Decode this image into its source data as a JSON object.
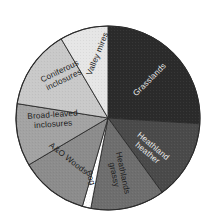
{
  "figure": {
    "title": "",
    "background_color": "#ffffff",
    "outline_color": "#2b2b2b",
    "center_x": 108,
    "center_y": 118,
    "radius": 92
  },
  "chart_data": {
    "type": "pie",
    "title": "",
    "xlabel": "",
    "ylabel": "",
    "legend_position": "none",
    "labels_inside_slices": true,
    "start_angle_deg": 0,
    "direction": "clockwise",
    "categories": [
      "Grasslands",
      "Heathland heather",
      "Heathlands grassy",
      "Bog",
      "A&O Woods",
      "Broad-leaved inclosures",
      "Coniferous inclosures",
      "Valley mires"
    ],
    "values": [
      26,
      14,
      13,
      1.5,
      12,
      11,
      14,
      8.5
    ],
    "colors": [
      "#2b2b2b",
      "#4a4a4a",
      "#6e6e6e",
      "#fefefe",
      "#8c8c8c",
      "#a3a3a3",
      "#c9c9c9",
      "#e6e6e6"
    ],
    "label_text_colors": [
      "#e8e8e8",
      "#e8e8e8",
      "#1c1c1c",
      "#1c1c1c",
      "#1c1c1c",
      "#1c1c1c",
      "#1c1c1c",
      "#1c1c1c"
    ],
    "slices": [
      {
        "name": "Grasslands",
        "label_lines": [
          "Grasslands"
        ],
        "value": 26,
        "color": "#2b2b2b",
        "text_color": "#e8e8e8",
        "label_x": 150,
        "label_y": 80,
        "label_rotation": -45,
        "font_size": 8.2
      },
      {
        "name": "Heathland heather",
        "label_lines": [
          "Heathland",
          "heather"
        ],
        "value": 14,
        "color": "#4a4a4a",
        "text_color": "#e8e8e8",
        "label_x": 150,
        "label_y": 150,
        "label_rotation": 40,
        "font_size": 7.6
      },
      {
        "name": "Heathlands grassy",
        "label_lines": [
          "Heathlands",
          "grassy"
        ],
        "value": 13,
        "color": "#6e6e6e",
        "text_color": "#1c1c1c",
        "label_x": 118,
        "label_y": 174,
        "label_rotation": 78,
        "font_size": 7.6
      },
      {
        "name": "Bog",
        "label_lines": [
          "Bog"
        ],
        "value": 1.5,
        "color": "#fefefe",
        "text_color": "#1c1c1c",
        "label_x": 90,
        "label_y": 178,
        "label_rotation": 71,
        "font_size": 5.6
      },
      {
        "name": "A&O Woods",
        "label_lines": [
          "A&O Woods"
        ],
        "value": 12,
        "color": "#8c8c8c",
        "text_color": "#1c1c1c",
        "label_x": 68,
        "label_y": 159,
        "label_rotation": 38,
        "font_size": 8.2
      },
      {
        "name": "Broad-leaved inclosures",
        "label_lines": [
          "Broad-leaved",
          "inclosures"
        ],
        "value": 11,
        "color": "#a3a3a3",
        "text_color": "#1c1c1c",
        "label_x": 53,
        "label_y": 120,
        "label_rotation": -4,
        "font_size": 8.2
      },
      {
        "name": "Coniferous inclosures",
        "label_lines": [
          "Coniferous",
          "inclosures"
        ],
        "value": 14,
        "color": "#c9c9c9",
        "text_color": "#1c1c1c",
        "label_x": 62,
        "label_y": 76,
        "label_rotation": -26,
        "font_size": 8.2
      },
      {
        "name": "Valley mires",
        "label_lines": [
          "Valley mires"
        ],
        "value": 8.5,
        "color": "#e6e6e6",
        "text_color": "#1c1c1c",
        "label_x": 98,
        "label_y": 54,
        "label_rotation": -68,
        "font_size": 8.2
      }
    ]
  }
}
